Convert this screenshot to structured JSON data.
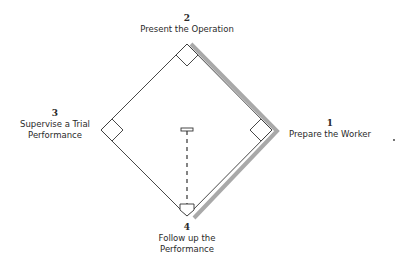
{
  "diagram": {
    "title": "",
    "steps": [
      {
        "number": "1",
        "label": "Prepare the Worker"
      },
      {
        "number": "2",
        "label": "Present the Operation"
      },
      {
        "number": "3",
        "label_line1": "Supervise a Trial",
        "label_line2": "Performance"
      },
      {
        "number": "4",
        "label_line1": "Follow up the",
        "label_line2": "Performance"
      }
    ],
    "colors": {
      "line": "#333333",
      "highlight": "#aaaaaa",
      "background": "#ffffff"
    },
    "stray_mark": "."
  }
}
